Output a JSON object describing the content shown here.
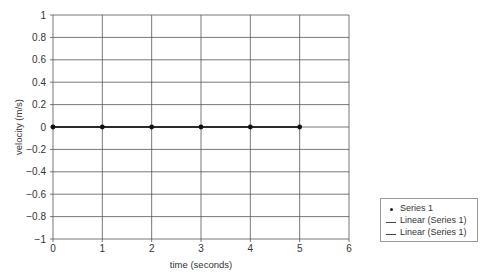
{
  "chart_data": {
    "type": "line",
    "title": "",
    "xlabel": "time (seconds)",
    "ylabel": "velocity (m/s)",
    "xlim": [
      0,
      6
    ],
    "ylim": [
      -1,
      1
    ],
    "x_ticks": [
      "0",
      "1",
      "2",
      "3",
      "4",
      "5",
      "6"
    ],
    "y_ticks": [
      "1",
      "0.8",
      "0.6",
      "0.4",
      "0.2",
      "0",
      "−0.2",
      "−0.4",
      "−0.6",
      "−0.8",
      "−1"
    ],
    "grid": true,
    "legend_position": "right-bottom",
    "series": [
      {
        "name": "Series 1",
        "style": "markers",
        "x": [
          0,
          1,
          2,
          3,
          4,
          5
        ],
        "y": [
          0,
          0,
          0,
          0,
          0,
          0
        ]
      },
      {
        "name": "Linear (Series 1)",
        "style": "line",
        "x": [
          0,
          5
        ],
        "y": [
          0,
          0
        ]
      },
      {
        "name": "Linear (Series 1)",
        "style": "line",
        "x": [
          0,
          5
        ],
        "y": [
          0,
          0
        ]
      }
    ]
  },
  "legend": {
    "items": [
      {
        "label": "Series 1",
        "symbol": "dot"
      },
      {
        "label": "Linear (Series 1)",
        "symbol": "line"
      },
      {
        "label": "Linear (Series 1)",
        "symbol": "line"
      }
    ]
  }
}
